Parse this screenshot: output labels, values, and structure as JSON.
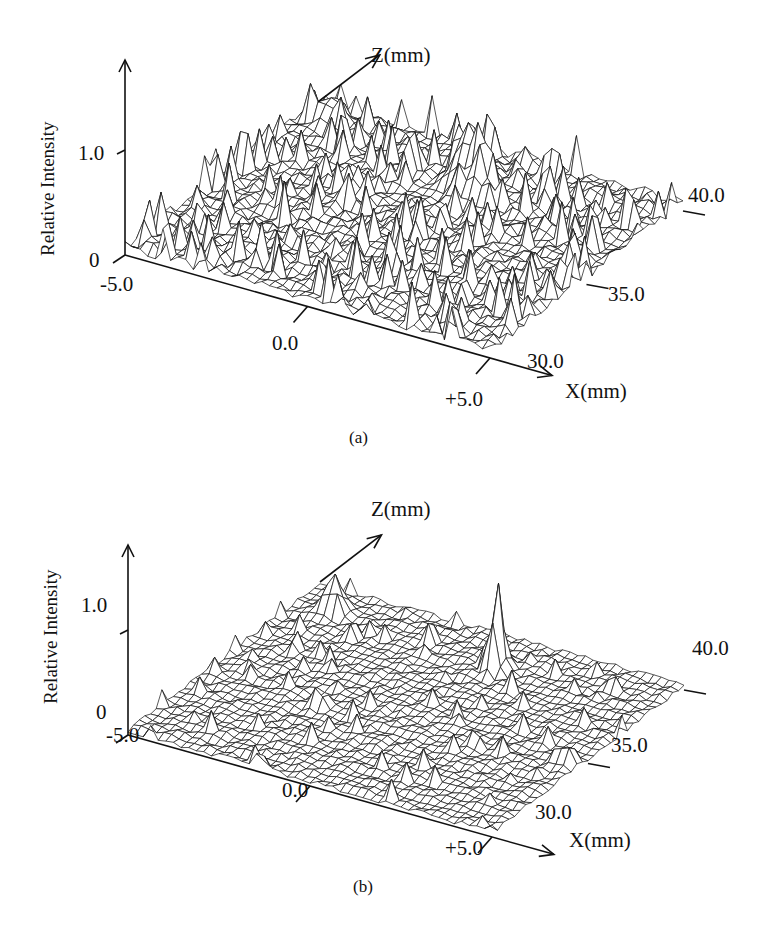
{
  "figure": {
    "panels": [
      {
        "id": "a",
        "caption": "(a)",
        "y_axis_label": "Relative Intensity",
        "x_axis_label": "X(mm)",
        "z_axis_label": "Z(mm)",
        "y_ticks": [
          "0",
          "1.0"
        ],
        "x_ticks": [
          "-5.0",
          "0.0",
          "+5.0"
        ],
        "z_ticks": [
          "30.0",
          "35.0",
          "40.0"
        ]
      },
      {
        "id": "b",
        "caption": "(b)",
        "y_axis_label": "Relative Intensity",
        "x_axis_label": "X(mm)",
        "z_axis_label": "Z(mm)",
        "y_ticks": [
          "0",
          "1.0"
        ],
        "x_ticks": [
          "-5.0",
          "0.0",
          "+5.0"
        ],
        "z_ticks": [
          "30.0",
          "35.0",
          "40.0"
        ]
      }
    ]
  },
  "chart_data": [
    {
      "type": "surface",
      "title": "(a)",
      "xlabel": "X(mm)",
      "zlabel": "Z(mm)",
      "ylabel": "Relative Intensity",
      "x_range": [
        -5.0,
        5.0
      ],
      "z_range": [
        30.0,
        40.0
      ],
      "intensity_range": [
        0,
        1.0
      ],
      "x_ticks": [
        -5.0,
        0.0,
        5.0
      ],
      "z_ticks": [
        30.0,
        35.0,
        40.0
      ],
      "intensity_ticks": [
        0,
        1.0
      ],
      "grid": false,
      "legend": null,
      "description": "Wireframe surface with dense, spiky noise over the whole X–Z plane; tallest peaks near X≈0 toward the back (Z≈37–39)",
      "background_level_approx": 0.3,
      "max_peak_approx": {
        "x": 0.0,
        "z": 38.0,
        "intensity": 0.9
      }
    },
    {
      "type": "surface",
      "title": "(b)",
      "xlabel": "X(mm)",
      "zlabel": "Z(mm)",
      "ylabel": "Relative Intensity",
      "x_range": [
        -5.0,
        5.0
      ],
      "z_range": [
        30.0,
        40.0
      ],
      "intensity_range": [
        0,
        1.0
      ],
      "x_ticks": [
        -5.0,
        0.0,
        5.0
      ],
      "z_ticks": [
        30.0,
        35.0,
        40.0
      ],
      "intensity_ticks": [
        0,
        1.0
      ],
      "grid": false,
      "legend": null,
      "description": "Wireframe surface with low, smoother background and one isolated sharp peak near X≈0 toward the back (Z≈38); a smaller peak near the back-left edge",
      "background_level_approx": 0.1,
      "max_peak_approx": {
        "x": 0.0,
        "z": 38.5,
        "intensity": 0.95
      },
      "secondary_peak_approx": {
        "x": -4.0,
        "z": 38.0,
        "intensity": 0.5
      }
    }
  ]
}
